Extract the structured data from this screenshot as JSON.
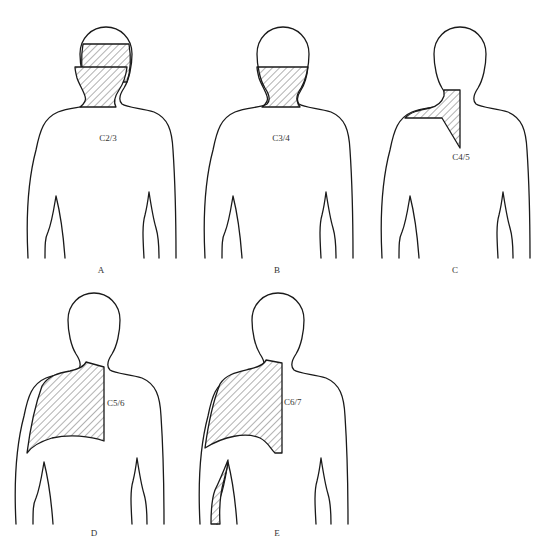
{
  "figure": {
    "type": "dermatome-diagram",
    "panels": [
      {
        "letter": "A",
        "level": "C2/3",
        "region": "head band (occiput)"
      },
      {
        "letter": "B",
        "level": "C3/4",
        "region": "neck"
      },
      {
        "letter": "C",
        "level": "C4/5",
        "region": "lower neck / upper shoulder"
      },
      {
        "letter": "D",
        "level": "C5/6",
        "region": "shoulder / scapula"
      },
      {
        "letter": "E",
        "level": "C6/7",
        "region": "scapula and upper arm"
      }
    ]
  },
  "colors": {
    "stroke": "#1a1a1a",
    "hatch": "#555555",
    "background": "#ffffff"
  }
}
